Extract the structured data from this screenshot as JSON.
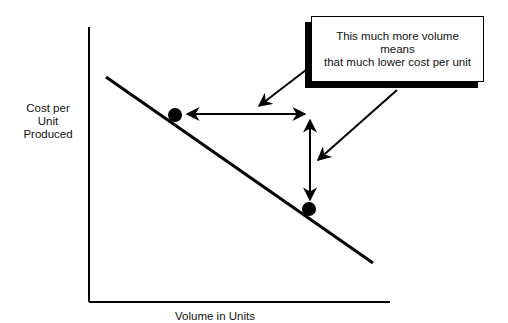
{
  "diagram": {
    "type": "economies-of-scale-curve",
    "y_axis_label": [
      "Cost per",
      "Unit",
      "Produced"
    ],
    "x_axis_label": "Volume in Units",
    "callout": {
      "lines": [
        "This much more volume",
        "means",
        "that much lower cost per unit"
      ]
    },
    "curve": {
      "shape": "straight line, downward slope",
      "start": [
        106,
        77
      ],
      "end": [
        373,
        263
      ]
    },
    "points": [
      {
        "name": "low-volume-point",
        "x": 175,
        "y": 115
      },
      {
        "name": "high-volume-point",
        "x": 309,
        "y": 209
      }
    ],
    "arrows": [
      {
        "name": "volume-difference-arrow",
        "orientation": "horizontal",
        "double_headed": true
      },
      {
        "name": "cost-difference-arrow",
        "orientation": "vertical",
        "double_headed": true
      },
      {
        "name": "callout-pointer-volume",
        "points_to": "volume-difference-arrow"
      },
      {
        "name": "callout-pointer-cost",
        "points_to": "cost-difference-arrow"
      }
    ],
    "colors": {
      "ink": "#000000",
      "background": "#ffffff"
    }
  }
}
